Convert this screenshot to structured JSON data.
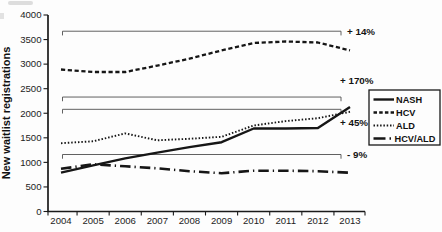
{
  "figure": {
    "background": "#fdfdfd",
    "ink_color": "#1a1a1a"
  },
  "chart_data": {
    "type": "line",
    "title": "",
    "xlabel": "",
    "ylabel": "New waitlist registrations",
    "x_years": [
      "2004",
      "2005",
      "2006",
      "2007",
      "2008",
      "2009",
      "2010",
      "2011",
      "2012",
      "2013"
    ],
    "ylim": [
      0,
      4000
    ],
    "ytick_step": 500,
    "ytick_labels": [
      "0",
      "500",
      "1000",
      "1500",
      "2000",
      "2500",
      "3000",
      "3500",
      "4000"
    ],
    "grid": false,
    "legend_position": "right",
    "series": [
      {
        "name": "NASH",
        "line_style": "solid",
        "values": [
          790,
          940,
          1080,
          1200,
          1310,
          1410,
          1690,
          1690,
          1700,
          2130
        ],
        "overall_change": "+ 170%"
      },
      {
        "name": "HCV",
        "line_style": "dashed",
        "values": [
          2890,
          2840,
          2840,
          2970,
          3110,
          3280,
          3430,
          3460,
          3440,
          3280
        ],
        "overall_change": "+ 14%"
      },
      {
        "name": "ALD",
        "line_style": "dotted",
        "values": [
          1390,
          1430,
          1590,
          1450,
          1480,
          1520,
          1750,
          1840,
          1900,
          2030
        ],
        "overall_change": "+ 45%"
      },
      {
        "name": "HCV/ALD",
        "line_style": "dashdot",
        "values": [
          870,
          960,
          920,
          880,
          820,
          780,
          830,
          830,
          820,
          790
        ],
        "overall_change": "- 9%"
      }
    ],
    "annotations": [
      {
        "label": "+ 14%",
        "series": "HCV",
        "bracket_value": 3670,
        "label_placement": "right"
      },
      {
        "label": "+ 170%",
        "series": "NASH",
        "bracket_value": 2330,
        "label_placement": "above-end"
      },
      {
        "label": "+ 45%",
        "series": "ALD",
        "bracket_value": 2080,
        "label_placement": "below-end"
      },
      {
        "label": "- 9%",
        "series": "HCV/ALD",
        "bracket_value": 1160,
        "label_placement": "right"
      }
    ]
  }
}
